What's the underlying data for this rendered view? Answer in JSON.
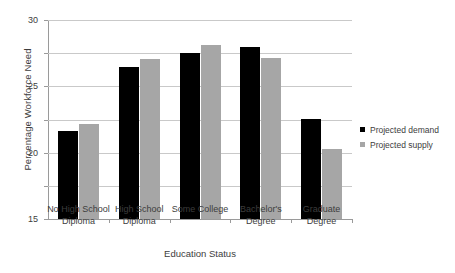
{
  "chart_data": {
    "type": "bar",
    "title": "",
    "xlabel": "Education Status",
    "ylabel": "Percentage Workforce Need",
    "ylim": [
      0,
      30
    ],
    "yticks": [
      0,
      5,
      10,
      15,
      20,
      25,
      30
    ],
    "ytick_labels": [
      "0",
      "5",
      "10",
      "15",
      "20",
      "25",
      "30"
    ],
    "grid": true,
    "legend_position": "right",
    "categories": [
      "No High School Diploma",
      "High School Diploma",
      "Some College",
      "Bachelor's Degree",
      "Graduate Degree"
    ],
    "category_lines": [
      [
        "No High School",
        "Diploma"
      ],
      [
        "High School",
        "Diploma"
      ],
      [
        "Some College",
        ""
      ],
      [
        "Bachelor's",
        "Degree"
      ],
      [
        "Graduate",
        "Degree"
      ]
    ],
    "series": [
      {
        "name": "Projected demand",
        "color": "#000000",
        "values": [
          13.3,
          22.9,
          25.0,
          26.0,
          15.1
        ]
      },
      {
        "name": "Projected supply",
        "color": "#a6a6a6",
        "values": [
          14.3,
          24.1,
          26.3,
          24.2,
          10.5
        ]
      }
    ]
  },
  "legend": {
    "items": [
      {
        "label": "Projected demand",
        "swatch": "#000000"
      },
      {
        "label": "Projected supply",
        "swatch": "#a6a6a6"
      }
    ]
  }
}
